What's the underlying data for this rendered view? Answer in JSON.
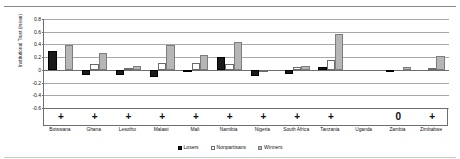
{
  "chart_data": {
    "type": "bar",
    "title": "",
    "xlabel": "",
    "ylabel": "Institutional Trust (mean)",
    "ylim": [
      -0.6,
      0.8
    ],
    "yticks": [
      0.8,
      0.6,
      0.4,
      0.2,
      0,
      -0.2,
      -0.4,
      -0.6
    ],
    "ytick_labels": [
      "0.8",
      "0.6",
      "0.4",
      "0.2",
      "0",
      "-0.2",
      "-0.4",
      "-0.6"
    ],
    "grid": true,
    "legend_position": "bottom",
    "categories": [
      "Botswana",
      "Ghana",
      "Lesotho",
      "Malawi",
      "Mali",
      "Namibia",
      "Nigeria",
      "South Africa",
      "Tanzania",
      "Uganda",
      "Zambia",
      "Zimbabwe"
    ],
    "series": [
      {
        "name": "Losers",
        "color": "#1a1a1a",
        "values": [
          0.29,
          -0.08,
          -0.08,
          -0.12,
          -0.04,
          0.21,
          -0.09,
          -0.07,
          0.05,
          0.0,
          -0.02,
          0.0
        ]
      },
      {
        "name": "Nonpartisans",
        "color": "#ffffff",
        "values": [
          0.0,
          0.09,
          0.03,
          0.11,
          0.11,
          0.1,
          -0.03,
          0.05,
          0.16,
          0.0,
          0.0,
          0.03
        ]
      },
      {
        "name": "Winners",
        "color": "#b6b6b6",
        "values": [
          0.39,
          0.27,
          0.06,
          0.39,
          0.23,
          0.44,
          0.0,
          0.06,
          0.57,
          0.0,
          0.04,
          0.22
        ]
      }
    ],
    "significance_row": [
      "+",
      "+",
      "+",
      "+",
      "+",
      "+",
      "+",
      "+",
      "+",
      "",
      "0",
      "+"
    ]
  },
  "legend": {
    "items": [
      {
        "label": "Losers",
        "swatch": "losers-swatch"
      },
      {
        "label": "Nonpartisans",
        "swatch": "nonpartisans-swatch"
      },
      {
        "label": "Winners",
        "swatch": "winners-swatch"
      }
    ]
  }
}
